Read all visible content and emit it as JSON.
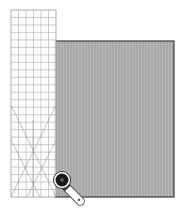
{
  "illustration": {
    "subject": "Rotary cutting fabric along a quilting ruler",
    "colors": {
      "background": "#ffffff",
      "fabric_fill": "#a9a9a9",
      "fabric_stripe": "#b8b8b8",
      "fabric_border": "#3a3a3a",
      "ruler_fill": "#ffffff",
      "ruler_grid": "#9a9a9a",
      "ruler_fine": "#cccccc",
      "cutter_handle": "#ffffff",
      "cutter_outline": "#555555",
      "cutter_blade": "#1a1a1a"
    },
    "ruler": {
      "x": 11,
      "y": 10,
      "width": 45,
      "height": 187,
      "columns": 6,
      "rows": 25
    },
    "fabric": {
      "x": 55,
      "y": 41,
      "width": 119,
      "height": 156
    },
    "cutter": {
      "blade_cx": 62,
      "blade_cy": 180,
      "blade_r": 8,
      "handle_end_x": 88,
      "handle_end_y": 204
    }
  }
}
